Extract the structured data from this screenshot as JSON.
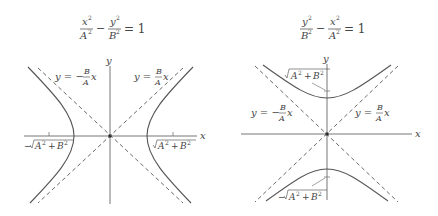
{
  "figures": [
    {
      "id": "horizontal-hyperbola",
      "equation": {
        "num1": "x",
        "den1": "A",
        "num2": "y",
        "den2": "B",
        "op": "−",
        "rhs": "= 1"
      },
      "axis_labels": {
        "x": "x",
        "y": "y"
      },
      "asymptote_labels": {
        "neg": "y = −",
        "pos": "y = ",
        "frac_num": "B",
        "frac_den": "A",
        "var": "x"
      },
      "focus_labels": {
        "neg": "−√A² + B²",
        "pos": "√A² + B²"
      }
    },
    {
      "id": "vertical-hyperbola",
      "equation": {
        "num1": "y",
        "den1": "B",
        "num2": "x",
        "den2": "A",
        "op": "−",
        "rhs": "= 1"
      },
      "axis_labels": {
        "x": "x",
        "y": "y"
      },
      "asymptote_labels": {
        "neg": "y = −",
        "pos": "y = ",
        "frac_num": "B",
        "frac_den": "A",
        "var": "x"
      },
      "focus_labels": {
        "pos": "√A² + B²",
        "neg": "−√A² + B²"
      }
    }
  ],
  "colors": {
    "curve": "#555555",
    "axis": "#777777",
    "dash": "#444444"
  }
}
